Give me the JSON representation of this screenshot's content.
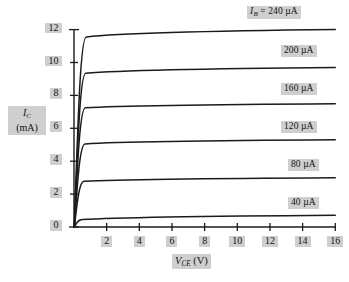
{
  "chart_data": {
    "type": "line",
    "title": "",
    "xlabel": "V_CE (V)",
    "ylabel": "I_C (mA)",
    "xlabel_main": "V",
    "xlabel_sub": "CE",
    "xlabel_unit": "(V)",
    "ylabel_main": "I",
    "ylabel_sub": "C",
    "ylabel_unit": "(mA)",
    "xlim": [
      0,
      16
    ],
    "ylim": [
      0,
      12.6
    ],
    "xticks": [
      2,
      4,
      6,
      8,
      10,
      12,
      14,
      16
    ],
    "yticks": [
      0,
      2,
      4,
      6,
      8,
      10,
      12
    ],
    "grid": false,
    "legend_position": "inline-right",
    "curve_color": "#1a1a1a",
    "axis_color": "#1a1a1a",
    "chip_color": "#cfcfcf",
    "series": [
      {
        "name": "IB_240",
        "label_prefix": "I",
        "label_sub": "B",
        "label_eq": " = ",
        "label_value": "240 µA",
        "label_full": "I_B = 240 µA",
        "ib_ua": 240,
        "knee_v": 0.75,
        "ic_at_knee": 11.55,
        "ic_at_16v": 12.0,
        "chip_left": 247,
        "chip_top": 6
      },
      {
        "name": "IB_200",
        "label_prefix": "",
        "label_sub": "",
        "label_eq": "",
        "label_value": "200 µA",
        "label_full": "200 µA",
        "ib_ua": 200,
        "knee_v": 0.72,
        "ic_at_knee": 9.35,
        "ic_at_16v": 9.7,
        "chip_left": 281,
        "chip_top": 45
      },
      {
        "name": "IB_160",
        "label_prefix": "",
        "label_sub": "",
        "label_eq": "",
        "label_value": "160 µA",
        "label_full": "160 µA",
        "ib_ua": 160,
        "knee_v": 0.7,
        "ic_at_knee": 7.25,
        "ic_at_16v": 7.5,
        "chip_left": 281,
        "chip_top": 83
      },
      {
        "name": "IB_120",
        "label_prefix": "",
        "label_sub": "",
        "label_eq": "",
        "label_value": "120 µA",
        "label_full": "120 µA",
        "ib_ua": 120,
        "knee_v": 0.68,
        "ic_at_knee": 5.05,
        "ic_at_16v": 5.3,
        "chip_left": 281,
        "chip_top": 121
      },
      {
        "name": "IB_80",
        "label_prefix": "",
        "label_sub": "",
        "label_eq": "",
        "label_value": "80 µA",
        "label_full": "80 µA",
        "ib_ua": 80,
        "knee_v": 0.62,
        "ic_at_knee": 2.78,
        "ic_at_16v": 3.0,
        "chip_left": 288,
        "chip_top": 159
      },
      {
        "name": "IB_40",
        "label_prefix": "",
        "label_sub": "",
        "label_eq": "",
        "label_value": "40 µA",
        "label_full": "40 µA",
        "ib_ua": 40,
        "knee_v": 0.5,
        "ic_at_knee": 0.45,
        "ic_at_16v": 0.72,
        "chip_left": 288,
        "chip_top": 197
      }
    ]
  },
  "axes": {
    "y_ticks": [
      {
        "value": 12,
        "label": "12"
      },
      {
        "value": 10,
        "label": "10"
      },
      {
        "value": 8,
        "label": "8"
      },
      {
        "value": 6,
        "label": "6"
      },
      {
        "value": 4,
        "label": "4"
      },
      {
        "value": 2,
        "label": "2"
      },
      {
        "value": 0,
        "label": "0"
      }
    ],
    "x_ticks": [
      {
        "value": 2,
        "label": "2"
      },
      {
        "value": 4,
        "label": "4"
      },
      {
        "value": 6,
        "label": "6"
      },
      {
        "value": 8,
        "label": "8"
      },
      {
        "value": 10,
        "label": "10"
      },
      {
        "value": 12,
        "label": "12"
      },
      {
        "value": 14,
        "label": "14"
      },
      {
        "value": 16,
        "label": "16"
      }
    ]
  }
}
